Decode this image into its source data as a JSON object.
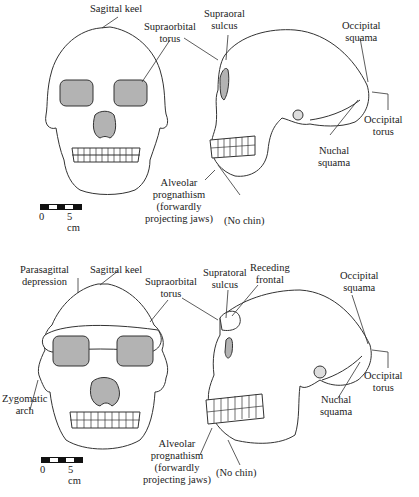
{
  "figure": {
    "top": {
      "frontal_view": {
        "labels": {
          "sagittal_keel": "Sagittal keel",
          "supraorbital_torus": [
            "Supraorbital",
            "torus"
          ]
        }
      },
      "lateral_view": {
        "labels": {
          "supraoral_sulcus": [
            "Supraoral",
            "sulcus"
          ],
          "occipital_squama": [
            "Occipital",
            "squama"
          ],
          "occipital_torus": [
            "Occipital",
            "torus"
          ],
          "nuchal_squama": [
            "Nuchal",
            "squama"
          ],
          "alveolar_prognathism": [
            "Alveolar",
            "prognathism",
            "(forwardly",
            "projecting jaws)"
          ],
          "no_chin": "(No chin)"
        }
      },
      "scale_bar": {
        "start": "0",
        "end": "5 cm"
      }
    },
    "bottom": {
      "frontal_view": {
        "labels": {
          "parasagittal_depression": [
            "Parasagittal",
            "depression"
          ],
          "sagittal_keel": "Sagittal keel",
          "supraorbital_torus": [
            "Supraorbital",
            "torus"
          ],
          "zygomatic_arch": [
            "Zygomatic",
            "arch"
          ]
        }
      },
      "lateral_view": {
        "labels": {
          "supratoral_sulcus": [
            "Supratoral",
            "sulcus"
          ],
          "receding_frontal": [
            "Receding",
            "frontal"
          ],
          "occipital_squama": [
            "Occipital",
            "squama"
          ],
          "occipital_torus": [
            "Occipital",
            "torus"
          ],
          "nuchal_squama": [
            "Nuchal",
            "squama"
          ],
          "alveolar_prognathism": [
            "Alveolar",
            "prognathism",
            "(forwardly",
            "projecting jaws)"
          ],
          "no_chin": "(No chin)"
        }
      },
      "scale_bar": {
        "start": "0",
        "end": "5 cm"
      }
    },
    "colors": {
      "line": "#333333",
      "orbit_fill": "#b3b3b3",
      "bone_fill": "#ffffff"
    }
  }
}
